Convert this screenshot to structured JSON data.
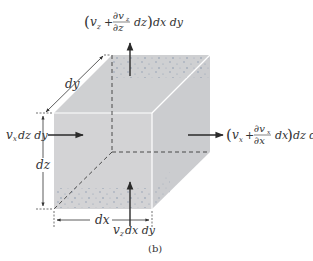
{
  "figure": {
    "caption": "(b)",
    "colors": {
      "face": "#d3d3d5",
      "face_side": "#cbcbcd",
      "face_top": "#c9cacd",
      "speckle": "#7f8fa8",
      "edge_visible": "#ffffff",
      "edge_hidden": "#3a3a3a",
      "arrow": "#2a2a2a",
      "text": "#333333"
    }
  },
  "labels": {
    "top_flux": {
      "open": "(",
      "v": "v",
      "sub": "z",
      "plus": "+",
      "num": "∂v",
      "num_sub": "z",
      "den": "∂z",
      "dz": "dz",
      "close": ")",
      "tail": "dx dy"
    },
    "right_flux": {
      "open": "(",
      "v": "v",
      "sub": "x",
      "plus": "+",
      "num": "∂v",
      "num_sub": "x",
      "den": "∂x",
      "dx": "dx",
      "close": ")",
      "tail": "dz dy"
    },
    "left_flux": {
      "v": "v",
      "sub": "x",
      "tail": "dz dy"
    },
    "bottom_flux": {
      "v": "v",
      "sub": "z",
      "tail": "dx dy"
    },
    "dim_dy": "dy",
    "dim_dz": "dz",
    "dim_dx": "dx"
  }
}
